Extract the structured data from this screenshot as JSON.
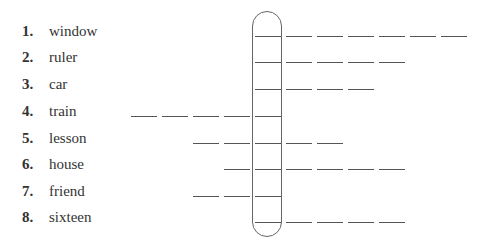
{
  "exercise": {
    "items": [
      {
        "number": "1.",
        "word": "window",
        "before": 0,
        "after": 6
      },
      {
        "number": "2.",
        "word": "ruler",
        "before": 0,
        "after": 4
      },
      {
        "number": "3.",
        "word": "car",
        "before": 0,
        "after": 3
      },
      {
        "number": "4.",
        "word": "train",
        "before": 4,
        "after": 0
      },
      {
        "number": "5.",
        "word": "lesson",
        "before": 2,
        "after": 2
      },
      {
        "number": "6.",
        "word": "house",
        "before": 1,
        "after": 4
      },
      {
        "number": "7.",
        "word": "friend",
        "before": 2,
        "after": 0
      },
      {
        "number": "8.",
        "word": "sixteen",
        "before": 0,
        "after": 4
      }
    ]
  }
}
